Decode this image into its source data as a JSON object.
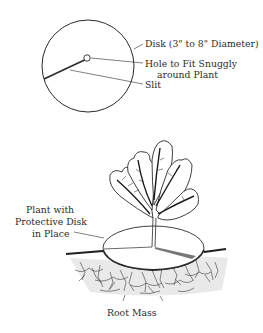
{
  "top_figure": {
    "labels": {
      "disk": "Disk (3\" to 8\" Diameter)",
      "hole_line1": "Hole to Fit Snuggly",
      "hole_line2": "around Plant",
      "slit": "Slit"
    }
  },
  "bottom_figure": {
    "labels": {
      "plant_line1": "Plant with",
      "plant_line2": "Protective Disk",
      "plant_line3": "in Place",
      "root_mass": "Root Mass"
    }
  },
  "colors": {
    "line": "#2a2a2a",
    "text": "#2b2b2b",
    "background": "#ffffff"
  }
}
